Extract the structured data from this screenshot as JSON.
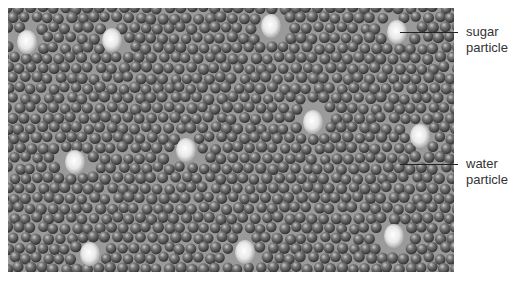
{
  "figure": {
    "labels": [
      {
        "id": "sugar",
        "text_line1": "sugar",
        "text_line2": "particle"
      },
      {
        "id": "water",
        "text_line1": "water",
        "text_line2": "particle"
      }
    ],
    "sugar_particles": [
      [
        19,
        34
      ],
      [
        104,
        32
      ],
      [
        263,
        18
      ],
      [
        389,
        24
      ],
      [
        305,
        114
      ],
      [
        412,
        128
      ],
      [
        67,
        154
      ],
      [
        178,
        142
      ],
      [
        82,
        246
      ],
      [
        237,
        244
      ],
      [
        386,
        228
      ]
    ],
    "colors": {
      "background": "#9a9a9a",
      "water_dark": "#3a3a3a",
      "water_light": "#b8b8b8",
      "sugar_light": "#ffffff",
      "sugar_dark": "#a8a8a8",
      "label_text": "#333333",
      "leader_line": "#222222"
    }
  }
}
